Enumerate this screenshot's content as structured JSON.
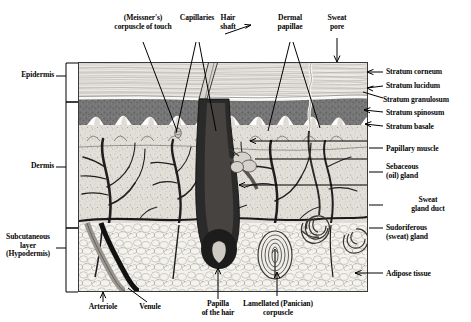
{
  "figure": {
    "background": "#ffffff",
    "ink": "#000000"
  },
  "labels": {
    "left_brackets": [
      {
        "id": "epidermis",
        "text": "Epidermis"
      },
      {
        "id": "dermis",
        "text": "Dermis"
      },
      {
        "id": "subcutaneous",
        "text": "Subcutaneous\nlayer\n(Hypodermis)"
      }
    ],
    "top": [
      {
        "id": "meissner",
        "text": "(Meissner's)\ncorpuscle of touch"
      },
      {
        "id": "capillaries",
        "text": "Capillaries"
      },
      {
        "id": "hair-shaft",
        "text": "Hair\nshaft"
      },
      {
        "id": "dermal-papillae",
        "text": "Dermal\npapillae"
      },
      {
        "id": "sweat-pore",
        "text": "Sweat\npore"
      }
    ],
    "right": [
      {
        "id": "stratum-corneum",
        "text": "Stratum corneum"
      },
      {
        "id": "stratum-lucidum",
        "text": "Stratum lucidum"
      },
      {
        "id": "stratum-granulosum",
        "text": "Stratum granulosum"
      },
      {
        "id": "stratum-spinosum",
        "text": "Stratum spinosum"
      },
      {
        "id": "stratum-basale",
        "text": "Stratum basale"
      },
      {
        "id": "papillary-muscle",
        "text": "Papillary muscle"
      },
      {
        "id": "sebaceous-gland",
        "text": "Sebaceous\n(oil) gland"
      },
      {
        "id": "sweat-gland-duct",
        "text": "Sweat\ngland duct"
      },
      {
        "id": "sudoriferous-gland",
        "text": "Sudoriferous\n(sweat) gland"
      },
      {
        "id": "adipose-tissue",
        "text": "Adipose tissue"
      }
    ],
    "bottom": [
      {
        "id": "arteriole",
        "text": "Arteriole"
      },
      {
        "id": "venule",
        "text": "Venule"
      },
      {
        "id": "papilla-hair",
        "text": "Papilla\nof the hair"
      },
      {
        "id": "lamellated-corpuscle",
        "text": "Lamellated (Panician)\ncorpuscle"
      }
    ]
  },
  "colors": {
    "stratum_corneum": "#e8e6e2",
    "epidermis_dark": "#6f6f6f",
    "dermis": "#dedbd6",
    "hypodermis": "#f2f0ec",
    "vessel_dark": "#1a1a1a",
    "vessel_gray": "#8a8a8a",
    "border": "#3a3a3a"
  }
}
